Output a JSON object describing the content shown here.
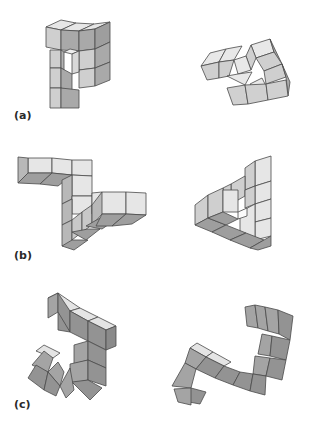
{
  "figure": {
    "colors": {
      "background": "#ffffff",
      "light_face": "#e6e6e6",
      "mid_face": "#c8c8c8",
      "dark_face": "#9a9a9a",
      "edge": "#4a4a4a",
      "label": "#2a2a2a"
    },
    "rows": [
      {
        "label": "(a)",
        "left": "object-a-left",
        "right": "object-a-right"
      },
      {
        "label": "(b)",
        "left": "object-b-left",
        "right": "object-b-right"
      },
      {
        "label": "(c)",
        "left": "object-c-left",
        "right": "object-c-right"
      }
    ]
  }
}
